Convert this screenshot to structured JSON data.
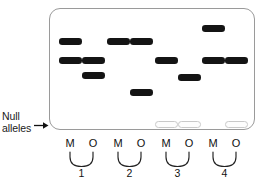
{
  "figure": {
    "type": "gel-electrophoresis-diagram",
    "width": 267,
    "height": 184,
    "background_color": "#ffffff"
  },
  "gel": {
    "border_color": "#9a9a9a",
    "fill_color": "#ffffff",
    "left": 49,
    "top": 8,
    "width": 206,
    "height": 122,
    "corner_radius": 11
  },
  "annotation": {
    "null_label_line1": "Null",
    "null_label_line2": "alleles",
    "arrow_icon": "right-arrow-icon",
    "arrow_color": "#111111"
  },
  "lanes": [
    {
      "id": "lane-1-m",
      "label": "M",
      "center_x": 70
    },
    {
      "id": "lane-1-o",
      "label": "O",
      "center_x": 93
    },
    {
      "id": "lane-2-m",
      "label": "M",
      "center_x": 118
    },
    {
      "id": "lane-2-o",
      "label": "O",
      "center_x": 141
    },
    {
      "id": "lane-3-m",
      "label": "M",
      "center_x": 166
    },
    {
      "id": "lane-3-o",
      "label": "O",
      "center_x": 189
    },
    {
      "id": "lane-4-m",
      "label": "M",
      "center_x": 213
    },
    {
      "id": "lane-4-o",
      "label": "O",
      "center_x": 236
    }
  ],
  "groups": [
    {
      "number": "1",
      "center_x": 81.5,
      "left_x": 70,
      "right_x": 93
    },
    {
      "number": "2",
      "center_x": 129.5,
      "left_x": 118,
      "right_x": 141
    },
    {
      "number": "3",
      "center_x": 177.5,
      "left_x": 166,
      "right_x": 189
    },
    {
      "number": "4",
      "center_x": 224.5,
      "left_x": 213,
      "right_x": 236
    }
  ],
  "bands": [
    {
      "lane": "lane-1-m",
      "x": 59,
      "y": 38,
      "width": 23,
      "kind": "allele"
    },
    {
      "lane": "lane-1-m",
      "x": 59,
      "y": 57,
      "width": 23,
      "kind": "allele"
    },
    {
      "lane": "lane-1-o",
      "x": 82,
      "y": 57,
      "width": 23,
      "kind": "allele"
    },
    {
      "lane": "lane-1-o",
      "x": 82,
      "y": 72,
      "width": 23,
      "kind": "allele"
    },
    {
      "lane": "lane-2-m",
      "x": 107,
      "y": 38,
      "width": 23,
      "kind": "allele"
    },
    {
      "lane": "lane-2-o",
      "x": 130,
      "y": 38,
      "width": 23,
      "kind": "allele"
    },
    {
      "lane": "lane-2-o",
      "x": 130,
      "y": 89,
      "width": 23,
      "kind": "allele"
    },
    {
      "lane": "lane-3-m",
      "x": 155,
      "y": 57,
      "width": 23,
      "kind": "allele"
    },
    {
      "lane": "lane-3-m",
      "x": 155,
      "y": 121,
      "width": 23,
      "kind": "null"
    },
    {
      "lane": "lane-3-o",
      "x": 178,
      "y": 74,
      "width": 23,
      "kind": "allele"
    },
    {
      "lane": "lane-3-o",
      "x": 178,
      "y": 121,
      "width": 23,
      "kind": "null"
    },
    {
      "lane": "lane-4-m",
      "x": 202,
      "y": 25,
      "width": 23,
      "kind": "allele"
    },
    {
      "lane": "lane-4-m",
      "x": 202,
      "y": 57,
      "width": 23,
      "kind": "allele"
    },
    {
      "lane": "lane-4-o",
      "x": 225,
      "y": 57,
      "width": 23,
      "kind": "allele"
    },
    {
      "lane": "lane-4-o",
      "x": 225,
      "y": 121,
      "width": 23,
      "kind": "null"
    }
  ]
}
